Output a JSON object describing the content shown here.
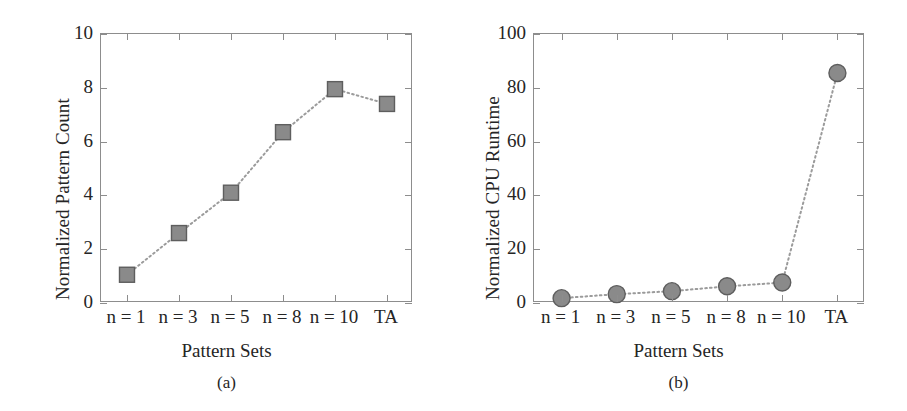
{
  "figure": {
    "panels": [
      {
        "id": "a",
        "caption": "(a)",
        "ylabel": "Normalized Pattern Count",
        "xlabel": "Pattern Sets"
      },
      {
        "id": "b",
        "caption": "(b)",
        "ylabel": "Normalized CPU Runtime",
        "xlabel": "Pattern Sets"
      }
    ]
  },
  "style": {
    "marker_fill": "#8a8a8a",
    "marker_stroke": "#5e5e5e",
    "line_color": "#9b9b9b",
    "axis_color": "#8d8d8d",
    "text_color": "#252525"
  },
  "chart_data": [
    {
      "type": "line",
      "id": "a",
      "title": "(a)",
      "xlabel": "Pattern Sets",
      "ylabel": "Normalized Pattern Count",
      "categories": [
        "n = 1",
        "n = 3",
        "n = 5",
        "n = 8",
        "n = 10",
        "TA"
      ],
      "values": [
        1.05,
        2.6,
        4.1,
        6.35,
        7.95,
        7.4
      ],
      "ylim": [
        0,
        10
      ],
      "yticks": [
        0,
        2,
        4,
        6,
        8,
        10
      ],
      "ytick_labels": [
        "0",
        "2",
        "4",
        "6",
        "8",
        "10"
      ],
      "marker": "square",
      "linestyle": "dotted",
      "grid": false,
      "legend": "none"
    },
    {
      "type": "line",
      "id": "b",
      "title": "(b)",
      "xlabel": "Pattern Sets",
      "ylabel": "Normalized CPU Runtime",
      "categories": [
        "n = 1",
        "n = 3",
        "n = 5",
        "n = 8",
        "n = 10",
        "TA"
      ],
      "values": [
        1.8,
        3.3,
        4.4,
        6.2,
        7.6,
        85.5
      ],
      "ylim": [
        0,
        100
      ],
      "yticks": [
        0,
        20,
        40,
        60,
        80,
        100
      ],
      "ytick_labels": [
        "0",
        "20",
        "40",
        "60",
        "80",
        "100"
      ],
      "marker": "circle",
      "linestyle": "dotted",
      "grid": false,
      "legend": "none"
    }
  ]
}
